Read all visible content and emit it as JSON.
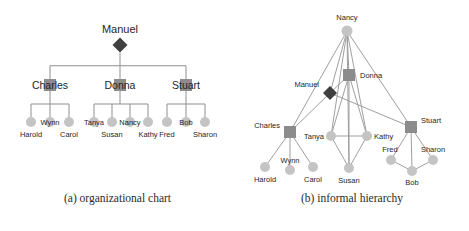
{
  "figure": {
    "panels": [
      {
        "id": "organizational-chart",
        "caption": "(a) organizational chart",
        "type": "tree"
      },
      {
        "id": "informal-hierarchy",
        "caption": "(b) informal hierarchy",
        "type": "network"
      }
    ]
  },
  "colors": {
    "diamond": "#3f3f3f",
    "square": "#8c8c8c",
    "circle": "#c4c4c4",
    "circle_top": "#d6d6d6",
    "edge": "#9a9a9a",
    "edge_tree": "#8f8f8f",
    "label": "#262626",
    "background": "#ffffff"
  },
  "chart_data": {
    "type": "diagram",
    "title": "",
    "panel_a": {
      "title": "(a) organizational chart",
      "layout": "top-down tree",
      "levels": [
        {
          "level": 0,
          "names": [
            "Manuel"
          ]
        },
        {
          "level": 1,
          "names": [
            "Charles",
            "Donna",
            "Stuart"
          ]
        },
        {
          "level": 2,
          "names": [
            "Harold",
            "Wynn",
            "Carol",
            "Tanya",
            "Susan",
            "Nancy",
            "Kathy",
            "Fred",
            "Bob",
            "Sharon"
          ]
        }
      ],
      "nodes": [
        {
          "name": "Manuel",
          "shape": "diamond",
          "x": 120,
          "y": 45,
          "label_dx": 0,
          "label_dy": -12,
          "anchor": "middle",
          "r": 7.5
        },
        {
          "name": "Charles",
          "shape": "square",
          "x": 50,
          "y": 85,
          "label_dx": 0,
          "label_dy": 4,
          "anchor": "middle",
          "r": 6
        },
        {
          "name": "Donna",
          "shape": "square",
          "x": 120,
          "y": 85,
          "label_dx": 0,
          "label_dy": 4,
          "anchor": "middle",
          "r": 6
        },
        {
          "name": "Stuart",
          "shape": "square",
          "x": 186,
          "y": 85,
          "label_dx": 0,
          "label_dy": 4,
          "anchor": "middle",
          "r": 6
        },
        {
          "name": "Harold",
          "shape": "circle",
          "x": 31,
          "y": 122,
          "label_dx": 0,
          "label_dy": 15,
          "anchor": "middle",
          "r": 5
        },
        {
          "name": "Wynn",
          "shape": "circle",
          "x": 50,
          "y": 122,
          "label_dx": 0,
          "label_dy": 3,
          "anchor": "middle",
          "r": 5
        },
        {
          "name": "Carol",
          "shape": "circle",
          "x": 69,
          "y": 122,
          "label_dx": 0,
          "label_dy": 15,
          "anchor": "middle",
          "r": 5
        },
        {
          "name": "Tanya",
          "shape": "circle",
          "x": 94,
          "y": 122,
          "label_dx": 0,
          "label_dy": 3,
          "anchor": "middle",
          "r": 5
        },
        {
          "name": "Susan",
          "shape": "circle",
          "x": 112,
          "y": 122,
          "label_dx": 0,
          "label_dy": 15,
          "anchor": "middle",
          "r": 5
        },
        {
          "name": "Nancy",
          "shape": "circle",
          "x": 130,
          "y": 122,
          "label_dx": 0,
          "label_dy": 3,
          "anchor": "middle",
          "r": 5
        },
        {
          "name": "Kathy",
          "shape": "circle",
          "x": 148,
          "y": 122,
          "label_dx": 0,
          "label_dy": 15,
          "anchor": "middle",
          "r": 5
        },
        {
          "name": "Fred",
          "shape": "circle",
          "x": 167,
          "y": 122,
          "label_dx": 0,
          "label_dy": 15,
          "anchor": "middle",
          "r": 5
        },
        {
          "name": "Bob",
          "shape": "circle",
          "x": 186,
          "y": 122,
          "label_dx": 0,
          "label_dy": 3,
          "anchor": "middle",
          "r": 5
        },
        {
          "name": "Sharon",
          "shape": "circle",
          "x": 205,
          "y": 122,
          "label_dx": 0,
          "label_dy": 15,
          "anchor": "middle",
          "r": 5
        }
      ],
      "edges": [
        {
          "from": "Manuel",
          "to": "Charles"
        },
        {
          "from": "Manuel",
          "to": "Donna"
        },
        {
          "from": "Manuel",
          "to": "Stuart"
        },
        {
          "from": "Charles",
          "to": "Harold"
        },
        {
          "from": "Charles",
          "to": "Wynn"
        },
        {
          "from": "Charles",
          "to": "Carol"
        },
        {
          "from": "Donna",
          "to": "Tanya"
        },
        {
          "from": "Donna",
          "to": "Susan"
        },
        {
          "from": "Donna",
          "to": "Nancy"
        },
        {
          "from": "Donna",
          "to": "Kathy"
        },
        {
          "from": "Stuart",
          "to": "Fred"
        },
        {
          "from": "Stuart",
          "to": "Bob"
        },
        {
          "from": "Stuart",
          "to": "Sharon"
        }
      ]
    },
    "panel_b": {
      "title": "(b) informal hierarchy",
      "layout": "force-directed network",
      "nodes": [
        {
          "name": "Nancy",
          "shape": "circle",
          "x": 112,
          "y": 31,
          "label_dx": 0,
          "label_dy": -11,
          "anchor": "middle",
          "r": 5.5
        },
        {
          "name": "Donna",
          "shape": "square",
          "x": 114,
          "y": 75,
          "label_dx": 11,
          "label_dy": 3,
          "anchor": "start",
          "r": 6
        },
        {
          "name": "Manuel",
          "shape": "diamond",
          "x": 95,
          "y": 93,
          "label_dx": -11,
          "label_dy": -6,
          "anchor": "end",
          "r": 7
        },
        {
          "name": "Charles",
          "shape": "square",
          "x": 55,
          "y": 132,
          "label_dx": -10,
          "label_dy": -4,
          "anchor": "end",
          "r": 6
        },
        {
          "name": "Stuart",
          "shape": "square",
          "x": 176,
          "y": 127,
          "label_dx": 10,
          "label_dy": -4,
          "anchor": "start",
          "r": 6
        },
        {
          "name": "Tanya",
          "shape": "circle",
          "x": 96,
          "y": 136,
          "label_dx": -7,
          "label_dy": 3,
          "anchor": "end",
          "r": 5
        },
        {
          "name": "Kathy",
          "shape": "circle",
          "x": 132,
          "y": 136,
          "label_dx": 7,
          "label_dy": 3,
          "anchor": "start",
          "r": 5
        },
        {
          "name": "Harold",
          "shape": "circle",
          "x": 30,
          "y": 167,
          "label_dx": 0,
          "label_dy": 15,
          "anchor": "middle",
          "r": 5
        },
        {
          "name": "Wynn",
          "shape": "circle",
          "x": 55,
          "y": 170,
          "label_dx": 0,
          "label_dy": -7,
          "anchor": "middle",
          "r": 5
        },
        {
          "name": "Carol",
          "shape": "circle",
          "x": 78,
          "y": 167,
          "label_dx": 0,
          "label_dy": 15,
          "anchor": "middle",
          "r": 5
        },
        {
          "name": "Susan",
          "shape": "circle",
          "x": 114,
          "y": 168,
          "label_dx": 0,
          "label_dy": 15,
          "anchor": "middle",
          "r": 5
        },
        {
          "name": "Fred",
          "shape": "circle",
          "x": 156,
          "y": 160,
          "label_dx": -1,
          "label_dy": -8,
          "anchor": "middle",
          "r": 5
        },
        {
          "name": "Sharon",
          "shape": "circle",
          "x": 198,
          "y": 160,
          "label_dx": 0,
          "label_dy": -8,
          "anchor": "middle",
          "r": 5
        },
        {
          "name": "Bob",
          "shape": "circle",
          "x": 177,
          "y": 171,
          "label_dx": 0,
          "label_dy": 14,
          "anchor": "middle",
          "r": 5
        }
      ],
      "edges": [
        {
          "from": "Nancy",
          "to": "Charles"
        },
        {
          "from": "Nancy",
          "to": "Manuel"
        },
        {
          "from": "Nancy",
          "to": "Donna"
        },
        {
          "from": "Nancy",
          "to": "Tanya"
        },
        {
          "from": "Nancy",
          "to": "Kathy"
        },
        {
          "from": "Nancy",
          "to": "Susan"
        },
        {
          "from": "Nancy",
          "to": "Stuart"
        },
        {
          "from": "Donna",
          "to": "Manuel"
        },
        {
          "from": "Donna",
          "to": "Tanya"
        },
        {
          "from": "Donna",
          "to": "Kathy"
        },
        {
          "from": "Donna",
          "to": "Susan"
        },
        {
          "from": "Manuel",
          "to": "Charles"
        },
        {
          "from": "Manuel",
          "to": "Stuart"
        },
        {
          "from": "Charles",
          "to": "Harold"
        },
        {
          "from": "Charles",
          "to": "Wynn"
        },
        {
          "from": "Charles",
          "to": "Carol"
        },
        {
          "from": "Tanya",
          "to": "Kathy"
        },
        {
          "from": "Tanya",
          "to": "Susan"
        },
        {
          "from": "Kathy",
          "to": "Susan"
        },
        {
          "from": "Stuart",
          "to": "Fred"
        },
        {
          "from": "Stuart",
          "to": "Sharon"
        },
        {
          "from": "Stuart",
          "to": "Bob"
        },
        {
          "from": "Fred",
          "to": "Bob"
        },
        {
          "from": "Sharon",
          "to": "Bob"
        }
      ]
    }
  }
}
